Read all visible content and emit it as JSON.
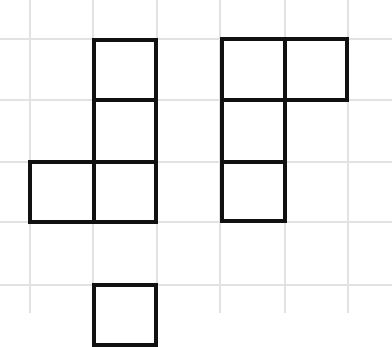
{
  "grid": {
    "line_color": "#e2e2e2",
    "vertical_x": [
      30,
      93,
      157,
      220,
      285,
      348
    ],
    "horizontal_y": [
      39,
      100,
      162,
      222,
      285
    ]
  },
  "stroke_color": "#111111",
  "shapes": [
    {
      "name": "left-polyomino",
      "cells": [
        {
          "x": 92,
          "y": 38,
          "w": 66,
          "h": 64
        },
        {
          "x": 92,
          "y": 98,
          "w": 66,
          "h": 66
        },
        {
          "x": 92,
          "y": 160,
          "w": 66,
          "h": 64
        },
        {
          "x": 28,
          "y": 160,
          "w": 68,
          "h": 64
        }
      ]
    },
    {
      "name": "right-polyomino",
      "cells": [
        {
          "x": 220,
          "y": 37,
          "w": 67,
          "h": 65
        },
        {
          "x": 283,
          "y": 37,
          "w": 66,
          "h": 65
        },
        {
          "x": 220,
          "y": 98,
          "w": 67,
          "h": 66
        },
        {
          "x": 220,
          "y": 160,
          "w": 67,
          "h": 63
        }
      ]
    },
    {
      "name": "bottom-partial-square",
      "cells": [
        {
          "x": 92,
          "y": 283,
          "w": 66,
          "h": 64
        }
      ]
    }
  ]
}
